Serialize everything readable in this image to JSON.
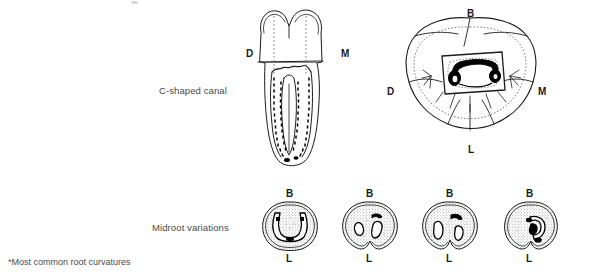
{
  "figure": {
    "row_labels": {
      "c_shaped_canal": "C-shaped canal",
      "midroot_variations": "Midroot variations"
    },
    "footnote": "*Most common root curvatures",
    "colors": {
      "line": "#1a1a1a",
      "fill_stipple": "#9a9a9a",
      "canal_black": "#000000",
      "background": "#ffffff",
      "text": "#4a4a4a"
    },
    "longitudinal_view": {
      "name": "longitudinal-section",
      "labels": {
        "distal": "D",
        "mesial": "M"
      }
    },
    "occlusal_view": {
      "name": "occlusal-section",
      "labels": {
        "buccal": "B",
        "distal": "D",
        "mesial": "M",
        "lingual": "L"
      }
    },
    "midroot_variations": [
      {
        "id": "variation-1",
        "labels": {
          "buccal": "B",
          "lingual": "L"
        },
        "canal_form": "continuous-c-shape"
      },
      {
        "id": "variation-2",
        "labels": {
          "buccal": "B",
          "lingual": "L"
        },
        "canal_form": "two-separate-canals"
      },
      {
        "id": "variation-3",
        "labels": {
          "buccal": "B",
          "lingual": "L"
        },
        "canal_form": "three-separate-canals"
      },
      {
        "id": "variation-4",
        "labels": {
          "buccal": "B",
          "lingual": "L"
        },
        "canal_form": "narrow-c-shape"
      }
    ]
  }
}
